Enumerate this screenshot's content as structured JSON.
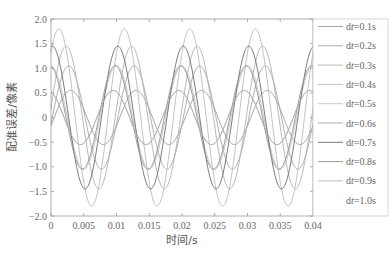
{
  "chart_data": {
    "type": "line",
    "title": "",
    "xlabel": "时间/s",
    "ylabel": "配准误差/像素",
    "xlim": [
      0,
      0.04
    ],
    "ylim": [
      -2.0,
      2.0
    ],
    "xticks": [
      "0",
      "0.005",
      "0.01",
      "0.015",
      "0.02",
      "0.025",
      "0.03",
      "0.035",
      "0.04"
    ],
    "yticks": [
      "2.0",
      "1.5",
      "1.0",
      "0.5",
      "0",
      "-0.5",
      "-1.0",
      "-1.5",
      "-2.0"
    ],
    "grid": false,
    "legend_position": "right",
    "period_s": 0.01,
    "series": [
      {
        "name": "dt=0.1s",
        "amplitude": 0.55,
        "phase_peak_t": 0.003,
        "color": "#9a9a9a"
      },
      {
        "name": "dt=0.2s",
        "amplitude": 1.05,
        "phase_peak_t": 0.0027,
        "color": "#a5a5a5"
      },
      {
        "name": "dt=0.3s",
        "amplitude": 1.45,
        "phase_peak_t": 0.0023,
        "color": "#b0b0b0"
      },
      {
        "name": "dt=0.4s",
        "amplitude": 1.8,
        "phase_peak_t": 0.0012,
        "color": "#bbbbbb"
      },
      {
        "name": "dt=0.5s",
        "amplitude": 1.05,
        "phase_peak_t": 0.0,
        "color": "#c2c2c2"
      },
      {
        "name": "dt=0.6s",
        "amplitude": 0.55,
        "phase_peak_t": 0.0095,
        "color": "#aaaaaa"
      },
      {
        "name": "dt=0.7s",
        "amplitude": 1.45,
        "phase_peak_t": 0.0002,
        "color": "#6a6a6a"
      },
      {
        "name": "dt=0.8s",
        "amplitude": 1.05,
        "phase_peak_t": 0.0098,
        "color": "#8f8f8f"
      },
      {
        "name": "dt=0.9s",
        "amplitude": 0.55,
        "phase_peak_t": 0.0095,
        "color": "#b5b5b5"
      },
      {
        "name": "dt=1.0s",
        "amplitude": 0.0,
        "phase_peak_t": 0.0,
        "color": "#ffffff"
      }
    ]
  },
  "legend": {
    "items": [
      "dt=0.1s",
      "dt=0.2s",
      "dt=0.3s",
      "dt=0.4s",
      "dt=0.5s",
      "dt=0.6s",
      "dt=0.7s",
      "dt=0.8s",
      "dt=0.9s",
      "dt=1.0s"
    ]
  },
  "axes": {
    "xlabel": "时间/s",
    "ylabel": "配准误差/像素"
  }
}
